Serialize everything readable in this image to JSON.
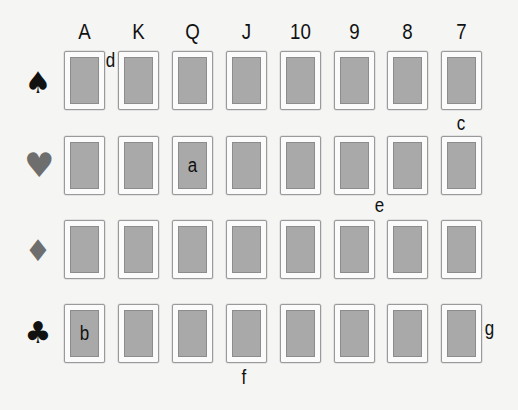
{
  "columns": [
    "A",
    "K",
    "Q",
    "J",
    "10",
    "9",
    "8",
    "7"
  ],
  "rows": [
    {
      "suit": "spades",
      "glyph": "♠",
      "color": "#111111"
    },
    {
      "suit": "hearts",
      "glyph": "♥",
      "color": "#6e6e6e"
    },
    {
      "suit": "diamonds",
      "glyph": "♦",
      "color": "#6e6e6e"
    },
    {
      "suit": "clubs",
      "glyph": "♣",
      "color": "#111111"
    }
  ],
  "card_labels": {
    "hearts_Q": "a",
    "clubs_A": "b"
  },
  "markers": {
    "d": "d",
    "c": "c",
    "e": "e",
    "f": "f",
    "g": "g"
  },
  "colors": {
    "background": "#f5f5f4",
    "card_face": "#a9a9a9",
    "card_border": "#9a9a9a"
  }
}
